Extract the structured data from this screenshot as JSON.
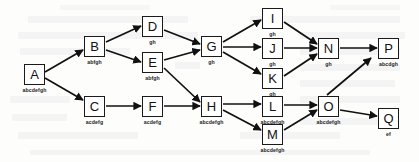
{
  "diagram": {
    "type": "directed-acyclic-graph",
    "title": "",
    "canvas": {
      "width": 419,
      "height": 162
    },
    "node_box": {
      "width": 21,
      "height": 21
    },
    "nodes": [
      {
        "id": "A",
        "letter": "A",
        "label": "abcdefgh",
        "x": 24,
        "y": 64
      },
      {
        "id": "B",
        "letter": "B",
        "label": "abfgh",
        "x": 84,
        "y": 36
      },
      {
        "id": "C",
        "letter": "C",
        "label": "acdefg",
        "x": 84,
        "y": 96
      },
      {
        "id": "D",
        "letter": "D",
        "label": "gh",
        "x": 142,
        "y": 16
      },
      {
        "id": "E",
        "letter": "E",
        "label": "abfgh",
        "x": 142,
        "y": 52
      },
      {
        "id": "F",
        "letter": "F",
        "label": "acdefg",
        "x": 142,
        "y": 96
      },
      {
        "id": "G",
        "letter": "G",
        "label": "gh",
        "x": 201,
        "y": 36
      },
      {
        "id": "H",
        "letter": "H",
        "label": "abcdefgh",
        "x": 201,
        "y": 96
      },
      {
        "id": "I",
        "letter": "I",
        "label": "gh",
        "x": 262,
        "y": 8
      },
      {
        "id": "J",
        "letter": "J",
        "label": "gh",
        "x": 262,
        "y": 38
      },
      {
        "id": "K",
        "letter": "K",
        "label": "gh",
        "x": 262,
        "y": 68
      },
      {
        "id": "L",
        "letter": "L",
        "label": "abcdefgh",
        "x": 262,
        "y": 96
      },
      {
        "id": "M",
        "letter": "M",
        "label": "abcdefgh",
        "x": 262,
        "y": 124
      },
      {
        "id": "N",
        "letter": "N",
        "label": "gh",
        "x": 318,
        "y": 38
      },
      {
        "id": "O",
        "letter": "O",
        "label": "abcdefgh",
        "x": 318,
        "y": 96
      },
      {
        "id": "P",
        "letter": "P",
        "label": "abcdgh",
        "x": 378,
        "y": 38
      },
      {
        "id": "Q",
        "letter": "Q",
        "label": "ef",
        "x": 378,
        "y": 108
      }
    ],
    "edges": [
      {
        "from": "A",
        "to": "B"
      },
      {
        "from": "A",
        "to": "C"
      },
      {
        "from": "B",
        "to": "D"
      },
      {
        "from": "B",
        "to": "E"
      },
      {
        "from": "C",
        "to": "F"
      },
      {
        "from": "D",
        "to": "G"
      },
      {
        "from": "E",
        "to": "G"
      },
      {
        "from": "E",
        "to": "H"
      },
      {
        "from": "F",
        "to": "H"
      },
      {
        "from": "G",
        "to": "I"
      },
      {
        "from": "G",
        "to": "J"
      },
      {
        "from": "G",
        "to": "K"
      },
      {
        "from": "H",
        "to": "L"
      },
      {
        "from": "H",
        "to": "M"
      },
      {
        "from": "I",
        "to": "N"
      },
      {
        "from": "J",
        "to": "N"
      },
      {
        "from": "K",
        "to": "N"
      },
      {
        "from": "L",
        "to": "O"
      },
      {
        "from": "M",
        "to": "O"
      },
      {
        "from": "N",
        "to": "P"
      },
      {
        "from": "O",
        "to": "P"
      },
      {
        "from": "O",
        "to": "Q"
      }
    ],
    "colors": {
      "node_border": "#1a1a1a",
      "node_fill": "#ffffff",
      "edge": "#111111",
      "text": "#111111",
      "background": "#fdfdfc"
    }
  }
}
